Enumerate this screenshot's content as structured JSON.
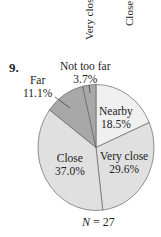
{
  "top_labels": [
    "Very close",
    "Close"
  ],
  "problem_number": "9.",
  "chart_data": {
    "type": "pie",
    "title": "",
    "categories": [
      "Nearby",
      "Very close",
      "Close",
      "Far",
      "Not too far"
    ],
    "values": [
      18.5,
      29.6,
      37.0,
      11.1,
      3.7
    ],
    "labels": [
      "18.5%",
      "29.6%",
      "37.0%",
      "11.1%",
      "3.7%"
    ],
    "colors": [
      "#f0f0f0",
      "#e0e0e0",
      "#e0e0e0",
      "#a8a8a8",
      "#a8a8a8"
    ],
    "start_angle_deg": 0,
    "direction": "clockwise",
    "note_variable": "N",
    "note_value": "= 27"
  }
}
